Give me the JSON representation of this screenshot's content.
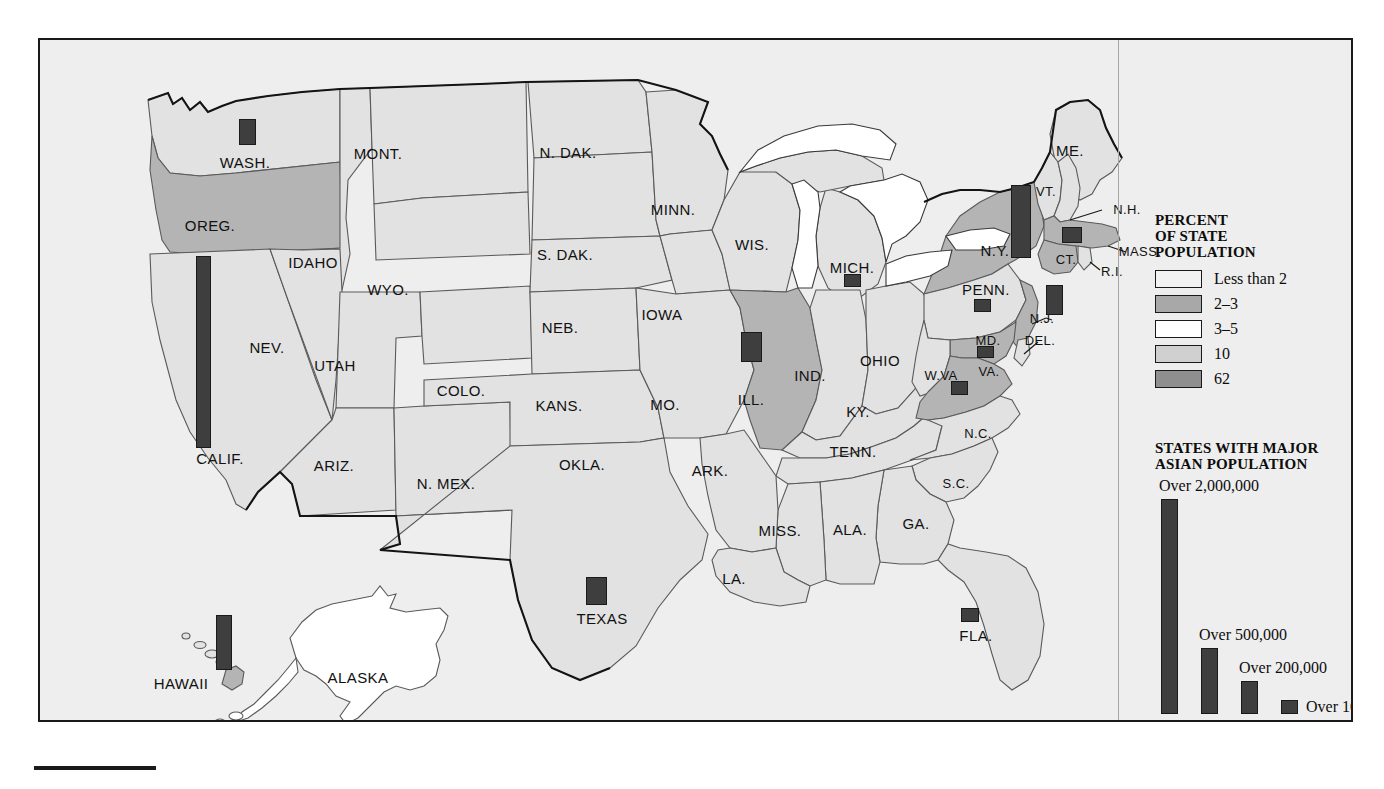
{
  "map": {
    "title": "Asian population distribution map of the United States",
    "background_color": "#eeeeee",
    "border_color": "#1a1a1a",
    "state_fill_default": "#e2e2e2",
    "water_fill": "#ffffff",
    "bar_color": "#3e3e3e"
  },
  "states": [
    {
      "code": "WASH.",
      "label": "WASH.",
      "x": 205,
      "y": 122,
      "shade": "less2"
    },
    {
      "code": "OREG.",
      "label": "OREG.",
      "x": 170,
      "y": 185,
      "shade": "p2_3"
    },
    {
      "code": "IDAHO",
      "label": "IDAHO",
      "x": 273,
      "y": 222,
      "shade": "less2"
    },
    {
      "code": "MONT.",
      "label": "MONT.",
      "x": 338,
      "y": 113,
      "shade": "less2"
    },
    {
      "code": "N. DAK.",
      "label": "N. DAK.",
      "x": 528,
      "y": 112,
      "shade": "less2"
    },
    {
      "code": "MINN.",
      "label": "MINN.",
      "x": 633,
      "y": 169,
      "shade": "less2"
    },
    {
      "code": "S. DAK.",
      "label": "S. DAK.",
      "x": 525,
      "y": 214,
      "shade": "less2"
    },
    {
      "code": "WYO.",
      "label": "WYO.",
      "x": 348,
      "y": 249,
      "shade": "less2"
    },
    {
      "code": "WIS.",
      "label": "WIS.",
      "x": 712,
      "y": 204,
      "shade": "less2"
    },
    {
      "code": "MICH.",
      "label": "MICH.",
      "x": 812,
      "y": 227,
      "shade": "less2"
    },
    {
      "code": "NEB.",
      "label": "NEB.",
      "x": 520,
      "y": 287,
      "shade": "less2"
    },
    {
      "code": "IOWA",
      "label": "IOWA",
      "x": 622,
      "y": 274,
      "shade": "less2"
    },
    {
      "code": "NEV.",
      "label": "NEV.",
      "x": 227,
      "y": 307,
      "shade": "less2"
    },
    {
      "code": "UTAH",
      "label": "UTAH",
      "x": 295,
      "y": 325,
      "shade": "less2"
    },
    {
      "code": "COLO.",
      "label": "COLO.",
      "x": 421,
      "y": 350,
      "shade": "less2"
    },
    {
      "code": "KANS.",
      "label": "KANS.",
      "x": 519,
      "y": 365,
      "shade": "less2"
    },
    {
      "code": "MO.",
      "label": "MO.",
      "x": 625,
      "y": 364,
      "shade": "less2"
    },
    {
      "code": "ILL.",
      "label": "ILL.",
      "x": 711,
      "y": 359,
      "shade": "p2_3"
    },
    {
      "code": "IND.",
      "label": "IND.",
      "x": 770,
      "y": 335,
      "shade": "less2"
    },
    {
      "code": "OHIO",
      "label": "OHIO",
      "x": 840,
      "y": 320,
      "shade": "less2"
    },
    {
      "code": "PENN.",
      "label": "PENN.",
      "x": 946,
      "y": 249,
      "shade": "less2"
    },
    {
      "code": "N.Y.",
      "label": "N.Y.",
      "x": 955,
      "y": 210,
      "shade": "p2_3"
    },
    {
      "code": "VT.",
      "label": "VT.",
      "x": 1006,
      "y": 151,
      "shade": "less2"
    },
    {
      "code": "ME.",
      "label": "ME.",
      "x": 1030,
      "y": 110,
      "shade": "less2"
    },
    {
      "code": "N.H.",
      "label": "N.H.",
      "x": 1087,
      "y": 169,
      "shade": "less2"
    },
    {
      "code": "MASS.",
      "label": "MASS.",
      "x": 1100,
      "y": 211,
      "shade": "p2_3"
    },
    {
      "code": "R.I.",
      "label": "R.I.",
      "x": 1072,
      "y": 231,
      "shade": "less2"
    },
    {
      "code": "CT.",
      "label": "CT.",
      "x": 1026,
      "y": 219,
      "shade": "p2_3"
    },
    {
      "code": "N.J.",
      "label": "N.J.",
      "x": 1002,
      "y": 278,
      "shade": "p2_3"
    },
    {
      "code": "DEL.",
      "label": "DEL.",
      "x": 1000,
      "y": 300,
      "shade": "less2"
    },
    {
      "code": "MD.",
      "label": "MD.",
      "x": 948,
      "y": 300,
      "shade": "p2_3"
    },
    {
      "code": "W.VA",
      "label": "W.VA",
      "x": 901,
      "y": 335,
      "shade": "less2"
    },
    {
      "code": "VA.",
      "label": "VA.",
      "x": 949,
      "y": 331,
      "shade": "p2_3"
    },
    {
      "code": "KY.",
      "label": "KY.",
      "x": 818,
      "y": 371,
      "shade": "less2"
    },
    {
      "code": "N.C.",
      "label": "N.C.",
      "x": 938,
      "y": 393,
      "shade": "less2"
    },
    {
      "code": "TENN.",
      "label": "TENN.",
      "x": 813,
      "y": 411,
      "shade": "less2"
    },
    {
      "code": "S.C.",
      "label": "S.C.",
      "x": 916,
      "y": 443,
      "shade": "less2"
    },
    {
      "code": "ARK.",
      "label": "ARK.",
      "x": 670,
      "y": 430,
      "shade": "less2"
    },
    {
      "code": "OKLA.",
      "label": "OKLA.",
      "x": 542,
      "y": 424,
      "shade": "less2"
    },
    {
      "code": "N. MEX.",
      "label": "N. MEX.",
      "x": 406,
      "y": 443,
      "shade": "less2"
    },
    {
      "code": "ARIZ.",
      "label": "ARIZ.",
      "x": 294,
      "y": 425,
      "shade": "less2"
    },
    {
      "code": "MISS.",
      "label": "MISS.",
      "x": 740,
      "y": 490,
      "shade": "less2"
    },
    {
      "code": "ALA.",
      "label": "ALA.",
      "x": 810,
      "y": 489,
      "shade": "less2"
    },
    {
      "code": "GA.",
      "label": "GA.",
      "x": 876,
      "y": 483,
      "shade": "less2"
    },
    {
      "code": "LA.",
      "label": "LA.",
      "x": 694,
      "y": 538,
      "shade": "less2"
    },
    {
      "code": "TEXAS",
      "label": "TEXAS",
      "x": 562,
      "y": 578,
      "shade": "less2"
    },
    {
      "code": "FLA.",
      "label": "FLA.",
      "x": 936,
      "y": 595,
      "shade": "less2"
    },
    {
      "code": "CALIF.",
      "label": "CALIF.",
      "x": 180,
      "y": 418,
      "shade": "less2"
    },
    {
      "code": "HAWAII",
      "label": "HAWAII",
      "x": 141,
      "y": 643,
      "shade": "less2"
    },
    {
      "code": "ALASKA",
      "label": "ALASKA",
      "x": 318,
      "y": 637,
      "shade": "less2"
    }
  ],
  "population_bars": [
    {
      "state": "CALIF.",
      "x": 156,
      "y": 216,
      "w": 15,
      "h": 192,
      "tier": "Over 2,000,000"
    },
    {
      "state": "HAWAII",
      "x": 176,
      "y": 575,
      "w": 16,
      "h": 55,
      "tier": "Over 500,000"
    },
    {
      "state": "WASH.",
      "x": 199,
      "y": 79,
      "w": 17,
      "h": 26,
      "tier": "Over 100,000"
    },
    {
      "state": "TEXAS",
      "x": 546,
      "y": 537,
      "w": 21,
      "h": 28,
      "tier": "Over 200,000"
    },
    {
      "state": "ILL.",
      "x": 701,
      "y": 292,
      "w": 21,
      "h": 30,
      "tier": "Over 200,000"
    },
    {
      "state": "MICH.",
      "x": 804,
      "y": 234,
      "w": 17,
      "h": 13,
      "tier": "Over 100,000"
    },
    {
      "state": "FLA.",
      "x": 921,
      "y": 568,
      "w": 18,
      "h": 14,
      "tier": "Over 100,000"
    },
    {
      "state": "VA.",
      "x": 911,
      "y": 341,
      "w": 17,
      "h": 14,
      "tier": "Over 100,000"
    },
    {
      "state": "MD.",
      "x": 937,
      "y": 306,
      "w": 17,
      "h": 12,
      "tier": "Over 100,000"
    },
    {
      "state": "PENN.",
      "x": 934,
      "y": 259,
      "w": 17,
      "h": 13,
      "tier": "Over 100,000"
    },
    {
      "state": "N.J.",
      "x": 1006,
      "y": 245,
      "w": 17,
      "h": 30,
      "tier": "Over 200,000"
    },
    {
      "state": "N.Y.",
      "x": 971,
      "y": 145,
      "w": 20,
      "h": 73,
      "tier": "Over 500,000"
    },
    {
      "state": "MASS.",
      "x": 1022,
      "y": 187,
      "w": 20,
      "h": 16,
      "tier": "Over 100,000"
    }
  ],
  "legend_percent": {
    "title_lines": [
      "PERCENT",
      "OF STATE",
      "POPULATION"
    ],
    "items": [
      {
        "label": "Less than 2",
        "color": "#f2f2f2"
      },
      {
        "label": "2–3",
        "color": "#a8a8a8"
      },
      {
        "label": "3–5",
        "color": "#ffffff"
      },
      {
        "label": "10",
        "color": "#d0d0d0"
      },
      {
        "label": "62",
        "color": "#8f8f8f"
      }
    ]
  },
  "legend_bars": {
    "title_lines": [
      "STATES WITH MAJOR",
      "ASIAN POPULATION"
    ],
    "items": [
      {
        "label": "Over 2,000,000",
        "bar_w": 17,
        "bar_h": 215
      },
      {
        "label": "Over 500,000",
        "bar_w": 17,
        "bar_h": 66
      },
      {
        "label": "Over 200,000",
        "bar_w": 17,
        "bar_h": 33
      },
      {
        "label": "Over 100,000",
        "bar_w": 17,
        "bar_h": 14
      }
    ]
  }
}
